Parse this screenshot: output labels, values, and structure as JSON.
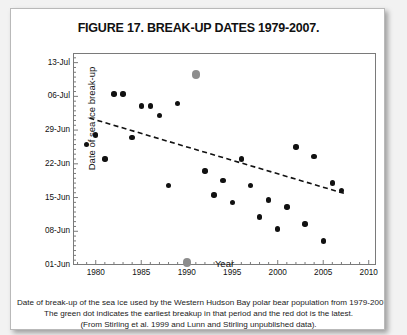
{
  "figure": {
    "title": "FIGURE 17. BREAK-UP DATES 1979-2007.",
    "caption_lines": [
      "Date of break-up of the sea ice used by the Western Hudson Bay polar bear population from 1979-2007.",
      "The green dot indicates the earliest breakup in that period and the red dot is the latest.",
      "(From Stirling et al. 1999 and Lunn and Stirling unpublished data)."
    ]
  },
  "colors": {
    "dot": "#111111",
    "highlight_dot": "#8d8d8d",
    "frame": "#7a7a7a",
    "trend_line": "#111111",
    "card_background": "#ffffff",
    "page_background": "#f2f2f2"
  },
  "chart_data": {
    "type": "scatter",
    "title": "FIGURE 17. BREAK-UP DATES 1979-2007.",
    "xlabel": "Year",
    "ylabel": "Date of sea ice break-up",
    "xlim": [
      1977.5,
      2010.8
    ],
    "ylim": [
      0,
      44
    ],
    "grid": false,
    "legend_position": "none",
    "xticks": [
      1980,
      1985,
      1990,
      1995,
      2000,
      2005,
      2010
    ],
    "yticks_values": [
      0,
      7,
      14,
      21,
      28,
      35,
      42
    ],
    "yticks_labels": [
      "01-Jun",
      "08-Jun",
      "15-Jun",
      "22-Jun",
      "29-Jun",
      "06-Jul",
      "13-Jul"
    ],
    "y_note": "y values are days after 01-Jun (0 = 01-Jun, 42 = 13-Jul)",
    "points": [
      {
        "year": 1979,
        "day": 25.0,
        "label": "26-Jun",
        "kind": "normal"
      },
      {
        "year": 1980,
        "day": 27.0,
        "label": "28-Jun",
        "kind": "normal"
      },
      {
        "year": 1981,
        "day": 22.0,
        "label": "23-Jun",
        "kind": "normal"
      },
      {
        "year": 1982,
        "day": 35.5,
        "label": "06-Jul",
        "kind": "normal"
      },
      {
        "year": 1983,
        "day": 35.5,
        "label": "06-Jul",
        "kind": "normal"
      },
      {
        "year": 1984,
        "day": 26.5,
        "label": "27-Jun",
        "kind": "normal"
      },
      {
        "year": 1985,
        "day": 33.0,
        "label": "04-Jul",
        "kind": "normal"
      },
      {
        "year": 1986,
        "day": 33.0,
        "label": "04-Jul",
        "kind": "normal"
      },
      {
        "year": 1987,
        "day": 31.0,
        "label": "02-Jul",
        "kind": "normal"
      },
      {
        "year": 1988,
        "day": 16.5,
        "label": "17-Jun",
        "kind": "normal"
      },
      {
        "year": 1989,
        "day": 33.5,
        "label": "04-Jul",
        "kind": "normal"
      },
      {
        "year": 1990,
        "day": 0.5,
        "label": "01-Jun",
        "kind": "earliest"
      },
      {
        "year": 1991,
        "day": 39.5,
        "label": "10-Jul",
        "kind": "latest"
      },
      {
        "year": 1992,
        "day": 19.5,
        "label": "20-Jun",
        "kind": "normal"
      },
      {
        "year": 1993,
        "day": 14.5,
        "label": "15-Jun",
        "kind": "normal"
      },
      {
        "year": 1994,
        "day": 17.5,
        "label": "18-Jun",
        "kind": "normal"
      },
      {
        "year": 1995,
        "day": 13.0,
        "label": "14-Jun",
        "kind": "normal"
      },
      {
        "year": 1996,
        "day": 22.0,
        "label": "23-Jun",
        "kind": "normal"
      },
      {
        "year": 1997,
        "day": 16.5,
        "label": "17-Jun",
        "kind": "normal"
      },
      {
        "year": 1998,
        "day": 10.0,
        "label": "11-Jun",
        "kind": "normal"
      },
      {
        "year": 1999,
        "day": 13.5,
        "label": "14-Jun",
        "kind": "normal"
      },
      {
        "year": 2000,
        "day": 7.5,
        "label": "08-Jun",
        "kind": "normal"
      },
      {
        "year": 2001,
        "day": 12.0,
        "label": "13-Jun",
        "kind": "normal"
      },
      {
        "year": 2002,
        "day": 24.5,
        "label": "25-Jun",
        "kind": "normal"
      },
      {
        "year": 2003,
        "day": 8.5,
        "label": "09-Jun",
        "kind": "normal"
      },
      {
        "year": 2004,
        "day": 22.5,
        "label": "24-Jun",
        "kind": "normal"
      },
      {
        "year": 2005,
        "day": 5.0,
        "label": "06-Jun",
        "kind": "normal"
      },
      {
        "year": 2006,
        "day": 17.0,
        "label": "18-Jun",
        "kind": "normal"
      },
      {
        "year": 2007,
        "day": 15.5,
        "label": "16-Jun",
        "kind": "normal"
      }
    ],
    "trend_line": {
      "style": "dashed",
      "x_start": 1979.3,
      "y_start": 30.5,
      "x_end": 2007.4,
      "y_end": 14.8
    }
  }
}
